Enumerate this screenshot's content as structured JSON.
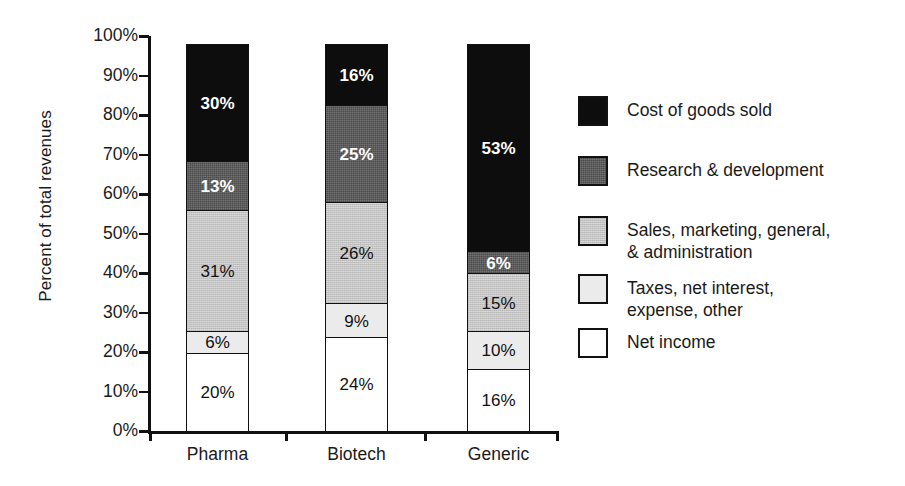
{
  "chart_data": {
    "type": "bar",
    "subtype": "stacked-percent",
    "title": "",
    "xlabel": "",
    "ylabel": "Percent of total revenues",
    "ylim": [
      0,
      100
    ],
    "y_tick_labels": [
      "100%",
      "90%",
      "80%",
      "70%",
      "60%",
      "50%",
      "40%",
      "30%",
      "20%",
      "10%",
      "0%"
    ],
    "y_tick_values": [
      100,
      90,
      80,
      70,
      60,
      50,
      40,
      30,
      20,
      10,
      0
    ],
    "grid": false,
    "legend_position": "right",
    "categories": [
      "Pharma",
      "Biotech",
      "Generic"
    ],
    "series": [
      {
        "name": "Cost of goods sold",
        "key": "cogs",
        "color": "#0d0d0d",
        "label_color": "light",
        "values": [
          30,
          16,
          53
        ],
        "value_labels": [
          "30%",
          "16%",
          "53%"
        ]
      },
      {
        "name": "Research & development",
        "key": "rnd",
        "color": "#4a4a4a",
        "label_color": "light",
        "values": [
          13,
          25,
          6
        ],
        "value_labels": [
          "13%",
          "25%",
          "6%"
        ]
      },
      {
        "name": "Sales, marketing, general,\n& administration",
        "key": "smga",
        "color": "#c3c3c3",
        "label_color": "dark",
        "values": [
          31,
          26,
          15
        ],
        "value_labels": [
          "31%",
          "26%",
          "15%"
        ]
      },
      {
        "name": "Taxes, net interest,\nexpense, other",
        "key": "taxes",
        "color": "#ebebeb",
        "label_color": "dark",
        "values": [
          6,
          9,
          10
        ],
        "value_labels": [
          "6%",
          "9%",
          "10%"
        ]
      },
      {
        "name": "Net income",
        "key": "net",
        "color": "#ffffff",
        "label_color": "dark",
        "values": [
          20,
          24,
          16
        ],
        "value_labels": [
          "20%",
          "24%",
          "16%"
        ]
      }
    ]
  },
  "axis": {
    "y_title": "Percent of total revenues",
    "y_ticks": [
      "100%",
      "90%",
      "80%",
      "70%",
      "60%",
      "50%",
      "40%",
      "30%",
      "20%",
      "10%",
      "0%"
    ],
    "x_categories": [
      "Pharma",
      "Biotech",
      "Generic"
    ]
  },
  "legend": {
    "items": [
      {
        "label": "Cost of goods sold",
        "swatch": "swatch-cost-of-goods-sold"
      },
      {
        "label": "Research & development",
        "swatch": "swatch-research-and-development"
      },
      {
        "label": "Sales, marketing, general,\n& administration",
        "swatch": "swatch-sales-marketing-general-administration"
      },
      {
        "label": "Taxes, net interest,\nexpense, other",
        "swatch": "swatch-taxes-net-interest-expense-other"
      },
      {
        "label": "Net income",
        "swatch": "swatch-net-income"
      }
    ]
  },
  "bar_labels": {
    "pharma": {
      "cogs": "30%",
      "rnd": "13%",
      "smga": "31%",
      "taxes": "6%",
      "net": "20%"
    },
    "biotech": {
      "cogs": "16%",
      "rnd": "25%",
      "smga": "26%",
      "taxes": "9%",
      "net": "24%"
    },
    "generic": {
      "cogs": "53%",
      "rnd": "6%",
      "smga": "15%",
      "taxes": "10%",
      "net": "16%"
    }
  }
}
